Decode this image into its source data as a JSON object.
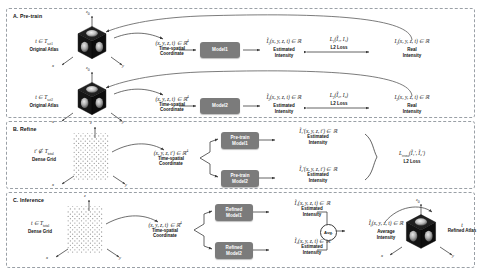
{
  "figure": {
    "sections": [
      {
        "key": "pretrain",
        "title": "A. Pre-train"
      },
      {
        "key": "refine",
        "title": "B. Refine"
      },
      {
        "key": "inference",
        "title": "C. Inference"
      }
    ]
  },
  "pretrain": {
    "row1": {
      "source_math": "t ∈ T",
      "source_sub": "set1",
      "source_caption": "Original Atlas",
      "coord_math": "(x, y, z, t) ∈ ℝ",
      "coord_sup": "4",
      "coord_caption_1": "Time-spatial",
      "coord_caption_2": "Coordinate",
      "model_label_1": "Model1",
      "est_math": "Ĩ",
      "est_sub": "1",
      "est_rest": "(x, y, z, t) ∈ ℝ",
      "est_caption_1": "Estimated",
      "est_caption_2": "Intensity",
      "loss_math": "L",
      "loss_sub": "1",
      "loss_args": "(Ĩ₁, I₁)",
      "loss_caption": "L2 Loss",
      "real_math": "I",
      "real_sub": "1",
      "real_rest": "(x, y, z, t) ∈ ℝ",
      "real_caption_1": "Real",
      "real_caption_2": "Intensity"
    },
    "row2": {
      "source_math": "t ∈ T",
      "source_sub": "set2",
      "source_caption": "Original Atlas",
      "coord_math": "(x, y, z, t) ∈ ℝ",
      "coord_sup": "4",
      "coord_caption_1": "Time-spatial",
      "coord_caption_2": "Coordinate",
      "model_label_2": "Model2",
      "est_math": "Ĩ",
      "est_sub": "2",
      "est_rest": "(x, y, z, t) ∈ ℝ",
      "est_caption_1": "Estimated",
      "est_caption_2": "Intensity",
      "loss_math": "L",
      "loss_sub": "2",
      "loss_args": "(Ĩ₂, I₂)",
      "loss_caption": "L2 Loss",
      "real_math": "I",
      "real_sub": "2",
      "real_rest": "(x, y, z, t) ∈ ℝ",
      "real_caption_1": "Real",
      "real_caption_2": "Intensity"
    }
  },
  "refine": {
    "source_math": "t′ ∉ T",
    "source_sub": "total",
    "source_caption": "Dense Grid",
    "coord_math": "(x, y, z, t′) ∈ ℝ",
    "coord_sup": "4",
    "coord_caption_1": "Time-spatial",
    "coord_caption_2": "Coordinate",
    "model1_line1": "Pre-train",
    "model1_line2": "Model1",
    "model2_line1": "Pre-train",
    "model2_line2": "Model2",
    "out1_math": "Ĩ₁′",
    "out1_rest": "(x, y, z, t′) ∈ ℝ",
    "out1_caption_1": "Estimated",
    "out1_caption_2": "Intensity",
    "out2_math": "Ĩ₂′",
    "out2_rest": "(x, y, z, t′) ∈ ℝ",
    "out2_caption_1": "Estimated",
    "out2_caption_2": "Intensity",
    "loss_math": "L",
    "loss_sub": "cross",
    "loss_args": "(Ĩ₁′, Ĩ₂′)",
    "loss_caption": "L2 Loss"
  },
  "inference": {
    "source_math": "t ∈ T",
    "source_sub": "total",
    "source_caption": "Dense Grid",
    "coord_math": "(x, y, z, t) ∈ ℝ",
    "coord_sup": "4",
    "coord_caption_1": "Time-spatial",
    "coord_caption_2": "Coordinate",
    "model1_line1": "Refined",
    "model1_line2": "Model1",
    "model2_line1": "Refined",
    "model2_line2": "Model2",
    "out1_math": "Ĩ₁",
    "out1_rest": "(x, y, z, t) ∈ ℝ",
    "out1_caption_1": "Estimated",
    "out1_caption_2": "Intensity",
    "out2_math": "Ĩ₂",
    "out2_rest": "(x, y, z, t) ∈ ℝ",
    "out2_caption_1": "Estimated",
    "out2_caption_2": "Intensity",
    "avg_label": "Avg.",
    "final_math": "Ĩ",
    "final_sub": "f",
    "final_rest": "(x, y, z, t) ∈ ℝ",
    "final_caption_1": "Average",
    "final_caption_2": "Intensity",
    "atlas_math": "t",
    "atlas_caption": "Refined Atlas"
  },
  "axes": {
    "x": "x",
    "y": "y",
    "z": "z",
    "zsub": "0"
  },
  "colors": {
    "model_box": "#7b7b7b",
    "panel_border": "#9aa0a6",
    "arrow": "#3c3c3c",
    "cube_dark": "#171717",
    "grid_dot": "#9b9b9b",
    "text": "#111111"
  }
}
